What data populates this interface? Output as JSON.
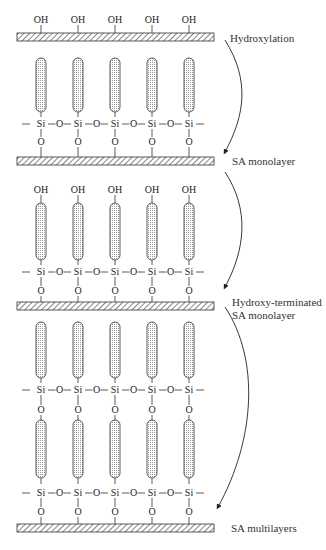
{
  "diagram": {
    "steps": [
      {
        "label": "Hydroxylation"
      },
      {
        "label": "SA monolayer"
      },
      {
        "label_line1": "Hydroxy-terminated",
        "label_line2": "SA monolayer"
      },
      {
        "label": "SA multilayers"
      }
    ],
    "atoms": {
      "hydroxyl": "OH",
      "silicon": "Si",
      "oxygen": "O"
    },
    "columns": 5
  }
}
